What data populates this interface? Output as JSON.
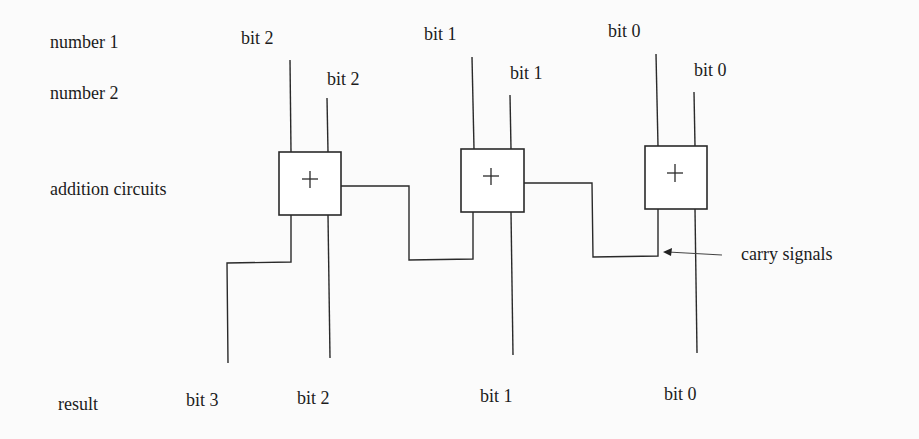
{
  "row_labels": {
    "number1": "number 1",
    "number2": "number 2",
    "addition": "addition circuits",
    "result": "result"
  },
  "inputs": {
    "number1": [
      "bit 2",
      "bit 1",
      "bit 0"
    ],
    "number2": [
      "bit 2",
      "bit 1",
      "bit 0"
    ]
  },
  "adders": [
    {
      "symbol": "+",
      "bit": 2
    },
    {
      "symbol": "+",
      "bit": 1
    },
    {
      "symbol": "+",
      "bit": 0
    }
  ],
  "outputs": [
    "bit 3",
    "bit 2",
    "bit 1",
    "bit 0"
  ],
  "annotation": {
    "carry": "carry signals"
  },
  "colors": {
    "ink": "#1c1c1c",
    "paper": "#fbfbfb"
  }
}
